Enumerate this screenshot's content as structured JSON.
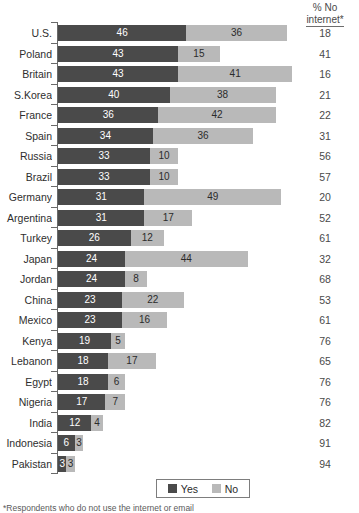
{
  "header": {
    "col_header_line1": "% No",
    "col_header_line2": "internet*"
  },
  "legend": {
    "yes_label": "Yes",
    "no_label": "No"
  },
  "footnote": {
    "text": "*Respondents who do not use the internet or email"
  },
  "colors": {
    "yes": "#4a4a4a",
    "no": "#b9b9b9",
    "axis": "#6a6a6a",
    "text": "#2e2e2e",
    "background": "#ffffff"
  },
  "chart_data": {
    "type": "bar",
    "title": "",
    "subtitle": "",
    "xlabel": "",
    "ylabel": "",
    "orientation": "horizontal",
    "stacked": true,
    "grid": false,
    "legend_position": "bottom",
    "xlim": [
      0,
      84
    ],
    "categories": [
      "U.S.",
      "Poland",
      "Britain",
      "S.Korea",
      "France",
      "Spain",
      "Russia",
      "Brazil",
      "Germany",
      "Argentina",
      "Turkey",
      "Japan",
      "Jordan",
      "China",
      "Mexico",
      "Kenya",
      "Lebanon",
      "Egypt",
      "Nigeria",
      "India",
      "Indonesia",
      "Pakistan"
    ],
    "series": [
      {
        "name": "Yes",
        "color": "#4a4a4a",
        "values": [
          46,
          43,
          43,
          40,
          36,
          34,
          33,
          33,
          31,
          31,
          26,
          24,
          24,
          23,
          23,
          19,
          18,
          18,
          17,
          12,
          6,
          3
        ]
      },
      {
        "name": "No",
        "color": "#b9b9b9",
        "values": [
          36,
          15,
          41,
          38,
          42,
          36,
          10,
          10,
          49,
          17,
          12,
          44,
          8,
          22,
          16,
          5,
          17,
          6,
          7,
          4,
          3,
          3
        ]
      }
    ],
    "annotation_column": {
      "header": "% No internet*",
      "values": [
        18,
        41,
        16,
        21,
        22,
        31,
        56,
        57,
        20,
        52,
        61,
        32,
        68,
        53,
        61,
        76,
        65,
        76,
        76,
        82,
        91,
        94
      ]
    }
  }
}
